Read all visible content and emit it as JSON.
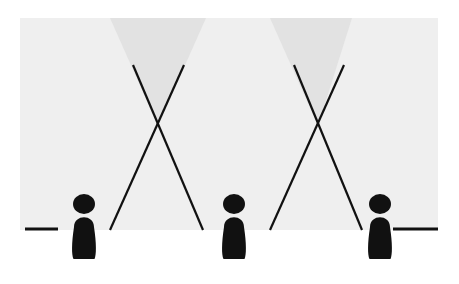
{
  "figure": {
    "type": "line-of-sight-diagram",
    "canvas": {
      "width": 459,
      "height": 284
    },
    "colors": {
      "background": "#ffffff",
      "panel": "#efefef",
      "cone": "#e2e2e2",
      "ink": "#111111",
      "ground_line": "#111111"
    }
  },
  "panel": {
    "name": "scene-panel",
    "x": 20,
    "y": 18,
    "width": 418,
    "height": 212
  },
  "ground": {
    "name": "ground-line",
    "y": 229,
    "segments": [
      {
        "label": "left-ground-segment",
        "x1": 25,
        "x2": 58
      },
      {
        "label": "right-ground-segment",
        "x1": 393,
        "x2": 438
      }
    ],
    "thickness": 3
  },
  "figures": [
    {
      "id": "figure-left",
      "label": "Left figure",
      "cx": 84,
      "head": {
        "cx": 84,
        "cy": 204,
        "rx": 11,
        "ry": 10
      },
      "body": {
        "cx": 84,
        "top": 218,
        "bottom": 259,
        "width": 25
      }
    },
    {
      "id": "figure-center",
      "label": "Center figure",
      "cx": 234,
      "head": {
        "cx": 234,
        "cy": 204,
        "rx": 11,
        "ry": 10
      },
      "body": {
        "cx": 234,
        "top": 218,
        "bottom": 259,
        "width": 25
      }
    },
    {
      "id": "figure-right",
      "label": "Right figure",
      "cx": 380,
      "head": {
        "cx": 380,
        "cy": 204,
        "rx": 11,
        "ry": 10
      },
      "body": {
        "cx": 380,
        "top": 218,
        "bottom": 259,
        "width": 25
      }
    }
  ],
  "crossings": [
    {
      "id": "crossing-left",
      "label": "Left crossing point",
      "x": 158,
      "y": 126,
      "cone": {
        "apex_x": 158,
        "apex_y": 126,
        "top_y": 18,
        "top_left_x": 110,
        "top_right_x": 206
      },
      "lines": [
        {
          "id": "sight-line-1",
          "x1": 133,
          "y1": 65,
          "x2": 203,
          "y2": 230
        },
        {
          "id": "sight-line-2",
          "x1": 184,
          "y1": 65,
          "x2": 110,
          "y2": 230
        }
      ]
    },
    {
      "id": "crossing-right",
      "label": "Right crossing point",
      "x": 318,
      "y": 126,
      "cone": {
        "apex_x": 318,
        "apex_y": 126,
        "top_y": 18,
        "top_left_x": 270,
        "top_right_x": 352
      },
      "lines": [
        {
          "id": "sight-line-3",
          "x1": 294,
          "y1": 65,
          "x2": 362,
          "y2": 230
        },
        {
          "id": "sight-line-4",
          "x1": 344,
          "y1": 65,
          "x2": 270,
          "y2": 230
        }
      ]
    }
  ],
  "line_style": {
    "stroke_width": 2.2,
    "stroke_linecap": "butt"
  },
  "labels": {
    "none_visible": ""
  }
}
